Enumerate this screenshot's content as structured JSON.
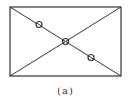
{
  "figure": {
    "caption": "(a)",
    "stroke_color": "#333333",
    "background": "#ffffff",
    "rectangle": {
      "x1": 10,
      "y1": 7,
      "x2": 121,
      "y2": 76
    },
    "diagonals": [
      {
        "name": "diagonal-top-left-to-bottom-right",
        "x1": 10,
        "y1": 7,
        "x2": 121,
        "y2": 76
      },
      {
        "name": "diagonal-bottom-left-to-top-right",
        "x1": 10,
        "y1": 76,
        "x2": 121,
        "y2": 7
      }
    ],
    "markers": [
      {
        "name": "marker-upper-left",
        "cx": 39,
        "cy": 24.5,
        "r": 3
      },
      {
        "name": "marker-center",
        "cx": 65.5,
        "cy": 41.5,
        "r": 3
      },
      {
        "name": "marker-lower-right",
        "cx": 91,
        "cy": 57.5,
        "r": 3
      }
    ]
  }
}
